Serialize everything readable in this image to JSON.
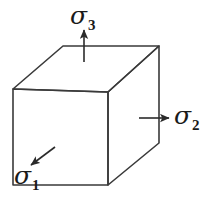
{
  "figure": {
    "name": "principal-stress-cube",
    "background_color": "#ffffff",
    "line_color": "#3a3a3a",
    "text_color": "#1a1a1a",
    "width": 208,
    "height": 201
  },
  "cube": {
    "name": "stress-element-cube",
    "vertices": {
      "front_top_left": [
        13,
        89
      ],
      "front_top_right": [
        108,
        92
      ],
      "front_bottom_left": [
        13,
        185
      ],
      "front_bottom_right": [
        108,
        185
      ],
      "back_top_left": [
        63,
        46
      ],
      "back_top_right": [
        159,
        46
      ],
      "back_bottom_right": [
        159,
        143
      ]
    },
    "faces": [
      "front",
      "top",
      "right"
    ],
    "stroke_width": 1.6
  },
  "stresses": [
    {
      "id": "sigma1",
      "symbol": "σ",
      "subscript": "1",
      "direction": "diagonal down-left (toward viewer)",
      "arrow": {
        "x1": 55,
        "y1": 148,
        "x2": 29,
        "y2": 167
      },
      "label_position": [
        14,
        163
      ]
    },
    {
      "id": "sigma2",
      "symbol": "σ",
      "subscript": "2",
      "direction": "horizontal right",
      "arrow": {
        "x1": 139,
        "y1": 118,
        "x2": 171,
        "y2": 118
      },
      "label_position": [
        174,
        103
      ]
    },
    {
      "id": "sigma3",
      "symbol": "σ",
      "subscript": "3",
      "direction": "vertical up",
      "arrow": {
        "x1": 84,
        "y1": 62,
        "x2": 84,
        "y2": 28
      },
      "label_position": [
        70,
        3
      ]
    }
  ]
}
